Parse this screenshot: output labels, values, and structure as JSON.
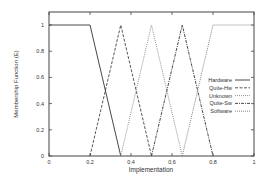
{
  "chart_data": {
    "type": "line",
    "title": "",
    "xlabel": "Implementation",
    "ylabel": "Membership Function (E)",
    "xlim": [
      0,
      1
    ],
    "ylim": [
      0,
      1.1
    ],
    "xticks": [
      "0",
      "0.2",
      "0.4",
      "0.6",
      "0.8",
      "1"
    ],
    "yticks": [
      "0",
      "0.2",
      "0.4",
      "0.6",
      "0.8",
      "1"
    ],
    "grid": false,
    "legend_position": "right-center inside",
    "series": [
      {
        "name": "Hardware",
        "style": "solid",
        "x": [
          0,
          0.2,
          0.35
        ],
        "y": [
          1,
          1,
          0
        ]
      },
      {
        "name": "Quite-Hw",
        "style": "dashed",
        "x": [
          0.2,
          0.35,
          0.5
        ],
        "y": [
          0,
          1,
          0
        ]
      },
      {
        "name": "Unknown",
        "style": "dotted",
        "x": [
          0.35,
          0.5,
          0.65
        ],
        "y": [
          0,
          1,
          0
        ]
      },
      {
        "name": "Quite-Sw",
        "style": "dash-dot",
        "x": [
          0.5,
          0.65,
          0.8
        ],
        "y": [
          0,
          1,
          0
        ]
      },
      {
        "name": "Software",
        "style": "dotted",
        "x": [
          0.65,
          0.8,
          1
        ],
        "y": [
          0,
          1,
          1
        ]
      }
    ]
  }
}
